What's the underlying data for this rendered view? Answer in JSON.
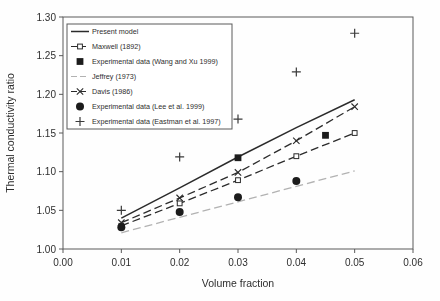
{
  "figure": {
    "background": "#fefefe"
  },
  "chart_data": {
    "type": "line",
    "title": "",
    "xlabel": "Volume fraction",
    "ylabel": "Thermal conductivity ratio",
    "xlim": [
      0.0,
      0.06
    ],
    "ylim": [
      1.0,
      1.3
    ],
    "x_ticks": [
      0.0,
      0.01,
      0.02,
      0.03,
      0.04,
      0.05,
      0.06
    ],
    "x_tick_labels": [
      "0.00",
      "0.01",
      "0.02",
      "0.03",
      "0.04",
      "0.05",
      "0.06"
    ],
    "y_ticks": [
      1.0,
      1.05,
      1.1,
      1.15,
      1.2,
      1.25,
      1.3
    ],
    "y_tick_labels": [
      "1.00",
      "1.05",
      "1.10",
      "1.15",
      "1.20",
      "1.25",
      "1.30"
    ],
    "grid": false,
    "frame": true,
    "legend_position": "upper-left",
    "colors": {
      "ink": "#2b2b2b",
      "light_line": "#b2b2b2",
      "frame": "#5a5a5a",
      "text": "#2e2e2e"
    },
    "series": [
      {
        "name": "Present model",
        "kind": "line",
        "line_style": "solid",
        "marker": "none",
        "color": "#2b2b2b",
        "x": [
          0.01,
          0.02,
          0.03,
          0.04,
          0.05
        ],
        "y": [
          1.04,
          1.079,
          1.119,
          1.157,
          1.193
        ]
      },
      {
        "name": "Maxwell (1892)",
        "kind": "line",
        "line_style": "dashed",
        "marker": "open-square",
        "color": "#2b2b2b",
        "x": [
          0.01,
          0.02,
          0.03,
          0.04,
          0.05
        ],
        "y": [
          1.03,
          1.059,
          1.089,
          1.12,
          1.15
        ]
      },
      {
        "name": "Experimental data (Wang and Xu 1999)",
        "kind": "scatter",
        "marker": "filled-square",
        "color": "#1c1c1c",
        "x": [
          0.03,
          0.045
        ],
        "y": [
          1.118,
          1.147
        ]
      },
      {
        "name": "Jeffrey (1973)",
        "kind": "line",
        "line_style": "dashed",
        "marker": "none",
        "color": "#b2b2b2",
        "x": [
          0.01,
          0.02,
          0.03,
          0.04,
          0.05
        ],
        "y": [
          1.021,
          1.041,
          1.061,
          1.081,
          1.101
        ]
      },
      {
        "name": "Davis (1986)",
        "kind": "line",
        "line_style": "dashed",
        "marker": "x",
        "color": "#2b2b2b",
        "x": [
          0.01,
          0.02,
          0.03,
          0.04,
          0.05
        ],
        "y": [
          1.034,
          1.066,
          1.099,
          1.14,
          1.184
        ]
      },
      {
        "name": "Experimental data (Lee et al. 1999)",
        "kind": "scatter",
        "marker": "filled-circle",
        "color": "#1c1c1c",
        "x": [
          0.01,
          0.02,
          0.03,
          0.04
        ],
        "y": [
          1.028,
          1.048,
          1.067,
          1.088
        ]
      },
      {
        "name": "Experimental data (Eastman et al. 1997)",
        "kind": "scatter",
        "marker": "plus",
        "color": "#3a3a3a",
        "x": [
          0.01,
          0.02,
          0.03,
          0.04,
          0.05
        ],
        "y": [
          1.05,
          1.119,
          1.168,
          1.229,
          1.279
        ]
      }
    ]
  }
}
